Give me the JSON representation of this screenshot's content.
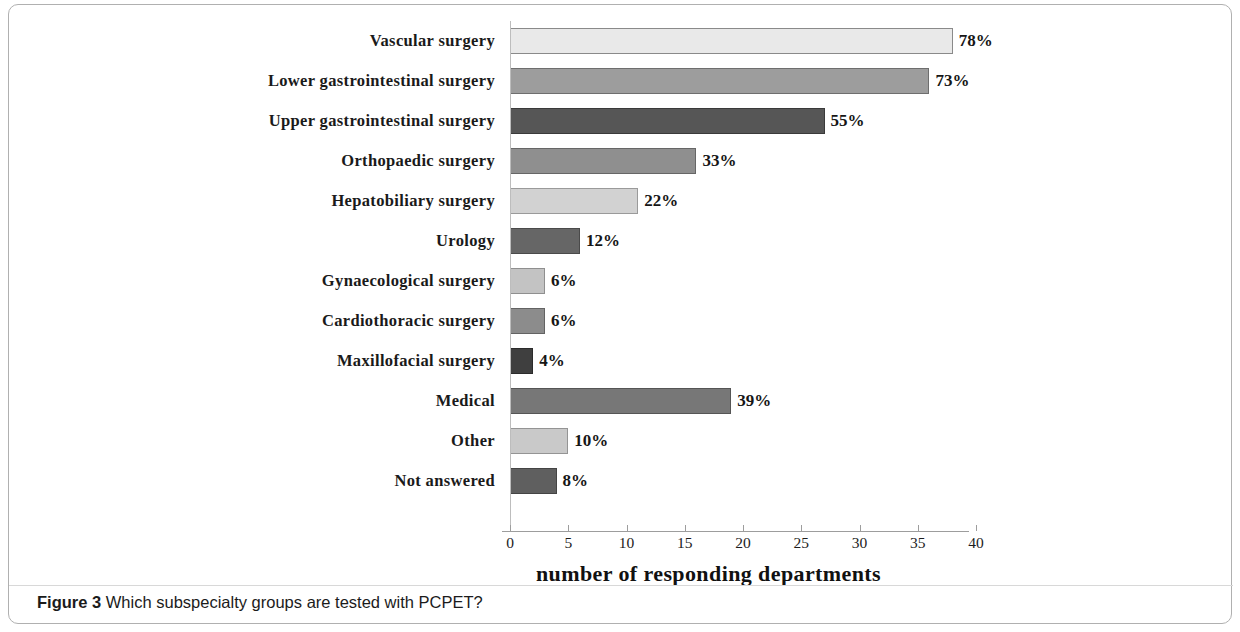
{
  "figure": {
    "caption_prefix": "Figure 3",
    "caption_text": "Which subspecialty groups are tested with PCPET?"
  },
  "chart_data": {
    "type": "bar",
    "orientation": "horizontal",
    "title": "",
    "xlabel": "number of responding departments",
    "ylabel": "",
    "xlim": [
      0,
      40
    ],
    "grid": false,
    "legend": "none",
    "xticks": [
      "0",
      "5",
      "10",
      "15",
      "20",
      "25",
      "30",
      "35",
      "40"
    ],
    "xtick_values": [
      0,
      5,
      10,
      15,
      20,
      25,
      30,
      35,
      40
    ],
    "categories": [
      "Vascular surgery",
      "Lower gastrointestinal surgery",
      "Upper gastrointestinal surgery",
      "Orthopaedic surgery",
      "Hepatobiliary surgery",
      "Urology",
      "Gynaecological surgery",
      "Cardiothoracic surgery",
      "Maxillofacial surgery",
      "Medical",
      "Other",
      "Not answered"
    ],
    "values": [
      38,
      36,
      27,
      16,
      11,
      6,
      3,
      3,
      2,
      19,
      5,
      4
    ],
    "data_labels": [
      "78%",
      "73%",
      "55%",
      "33%",
      "22%",
      "12%",
      "6%",
      "6%",
      "4%",
      "39%",
      "10%",
      "8%"
    ],
    "bar_colors": [
      "#e9e9e9",
      "#9d9d9d",
      "#565656",
      "#8f8f8f",
      "#d2d2d2",
      "#666666",
      "#c3c3c3",
      "#8c8c8c",
      "#3f3f3f",
      "#777777",
      "#c9c9c9",
      "#5f5f5f"
    ],
    "bar_border_colors": [
      "#8a8a8a",
      "#6e6e6e",
      "#3a3a3a",
      "#666666",
      "#9a9a9a",
      "#4a4a4a",
      "#8f8f8f",
      "#636363",
      "#2b2b2b",
      "#555555",
      "#949494",
      "#444444"
    ]
  }
}
